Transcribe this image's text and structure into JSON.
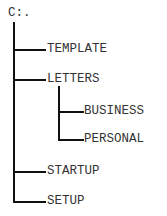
{
  "tree": {
    "root": "C:.",
    "children": [
      {
        "label": "TEMPLATE"
      },
      {
        "label": "LETTERS",
        "children": [
          {
            "label": "BUSINESS"
          },
          {
            "label": "PERSONAL"
          }
        ]
      },
      {
        "label": "STARTUP"
      },
      {
        "label": "SETUP"
      }
    ]
  }
}
